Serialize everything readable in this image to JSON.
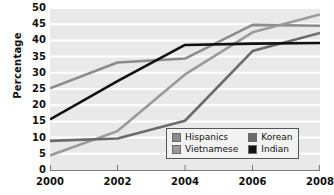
{
  "chart_data": {
    "type": "line",
    "title": "",
    "xlabel": "",
    "ylabel": "Percentage",
    "x": [
      2000,
      2002,
      2004,
      2006,
      2008
    ],
    "categories": [
      "2000",
      "2002",
      "2004",
      "2006",
      "2008"
    ],
    "xlim": [
      2000,
      2008
    ],
    "ylim": [
      0,
      50
    ],
    "ytick_values": [
      0,
      5,
      10,
      15,
      20,
      25,
      30,
      35,
      40,
      45,
      50
    ],
    "ytick_labels": [
      "0",
      "5",
      "10",
      "15",
      "20",
      "25",
      "30",
      "35",
      "40",
      "45",
      "50"
    ],
    "xtick_labels": [
      "2000",
      "2002",
      "2004",
      "2006",
      "2008"
    ],
    "grid": "horizontal",
    "grid_color": "#ffffff",
    "plot_background": "#e9e9e9",
    "legend_position": "lower-right",
    "series": [
      {
        "name": "Hispanics",
        "values": [
          25.2,
          33.2,
          34.4,
          44.8,
          44.5
        ],
        "color": "#8c8c8c"
      },
      {
        "name": "Vietnamese",
        "values": [
          4.5,
          12.0,
          29.5,
          42.5,
          48.0
        ],
        "color": "#9a9a9a"
      },
      {
        "name": "Korean",
        "values": [
          9.0,
          9.7,
          15.2,
          36.7,
          42.3
        ],
        "color": "#6b6b6b"
      },
      {
        "name": "Indian",
        "values": [
          15.6,
          27.4,
          38.6,
          39.0,
          39.2
        ],
        "color": "#111111"
      }
    ]
  },
  "legend": {
    "entries": [
      {
        "label": "Hispanics",
        "color": "#8c8c8c"
      },
      {
        "label": "Korean",
        "color": "#6b6b6b"
      },
      {
        "label": "Vietnamese",
        "color": "#9a9a9a"
      },
      {
        "label": "Indian",
        "color": "#111111"
      }
    ]
  }
}
